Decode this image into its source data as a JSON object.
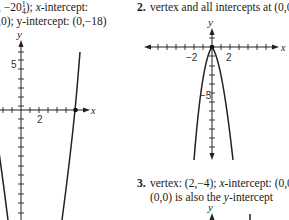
{
  "problem1": {
    "line1_prefix": ", −20",
    "line1_frac_num": "1",
    "line1_frac_den": "4",
    "line1_suffix": "); ",
    "line1_xint_label": "x",
    "line1_xint_rest": "-intercept:",
    "line2_prefix": ",0); ",
    "line2_yint_label": "y",
    "line2_yint_rest": "-intercept: (0,−18)",
    "graph": {
      "x_axis_label": "x",
      "y_axis_label": "y",
      "y_tick_label": "5",
      "x_tick_label": "2"
    }
  },
  "problem2": {
    "number": "2.",
    "text": "vertex and all intercepts at (0,0)",
    "graph": {
      "x_axis_label": "x",
      "y_axis_label": "y",
      "x_tick_labels": [
        "−2",
        "2"
      ],
      "y_tick_label": "−5"
    }
  },
  "problem3": {
    "number": "3.",
    "line1_a": "vertex: (2,−4); ",
    "line1_xint_label": "x",
    "line1_b": "-intercept: (0,0",
    "line2_a": "(0,0) is also the ",
    "line2_yint_label": "y",
    "line2_b": "-intercept",
    "graph": {
      "y_axis_label": "y"
    }
  }
}
